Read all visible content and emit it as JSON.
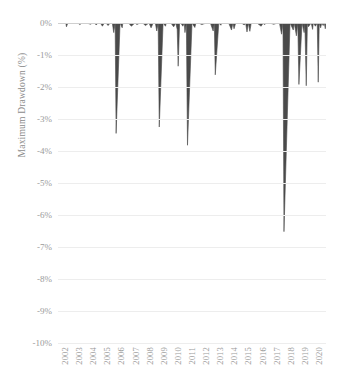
{
  "chart_data": {
    "type": "area",
    "title": "",
    "subtitle": "",
    "xlabel": "",
    "ylabel": "Maximum Drawdown (%)",
    "ylim": [
      -10,
      0
    ],
    "xlim": [
      2002,
      2021
    ],
    "grid": true,
    "legend": "none",
    "series_color": "#4a4a4a",
    "y_ticks": [
      "0%",
      "-1%",
      "-2%",
      "-3%",
      "-4%",
      "-5%",
      "-6%",
      "-7%",
      "-8%",
      "-9%",
      "-10%"
    ],
    "y_tick_values": [
      0,
      -1,
      -2,
      -3,
      -4,
      -5,
      -6,
      -7,
      -8,
      -9,
      -10
    ],
    "x_ticks": [
      "2002",
      "2003",
      "2004",
      "2005",
      "2006",
      "2007",
      "2008",
      "2009",
      "2010",
      "2011",
      "2012",
      "2013",
      "2014",
      "2015",
      "2016",
      "2017",
      "2018",
      "2019",
      "2020"
    ],
    "x_tick_values": [
      2002,
      2003,
      2004,
      2005,
      2006,
      2007,
      2008,
      2009,
      2010,
      2011,
      2012,
      2013,
      2014,
      2015,
      2016,
      2017,
      2018,
      2019,
      2020
    ],
    "series": [
      {
        "name": "Maximum Drawdown",
        "x": [
          2002.0,
          2002.3,
          2002.55,
          2002.6,
          2002.7,
          2003.1,
          2003.4,
          2003.55,
          2003.7,
          2003.9,
          2004.05,
          2004.3,
          2004.45,
          2004.6,
          2004.7,
          2004.85,
          2005.0,
          2005.15,
          2005.28,
          2005.4,
          2005.55,
          2005.7,
          2005.85,
          2005.95,
          2006.05,
          2006.12,
          2006.4,
          2006.55,
          2006.6,
          2006.8,
          2007.0,
          2007.2,
          2007.45,
          2007.6,
          2007.8,
          2008.0,
          2008.2,
          2008.45,
          2008.6,
          2008.75,
          2008.9,
          2009.0,
          2009.1,
          2009.18,
          2009.45,
          2009.62,
          2009.68,
          2009.85,
          2010.0,
          2010.2,
          2010.35,
          2010.45,
          2010.52,
          2010.62,
          2010.7,
          2010.85,
          2010.95,
          2011.0,
          2011.1,
          2011.18,
          2011.5,
          2011.7,
          2011.78,
          2011.95,
          2012.2,
          2012.5,
          2012.8,
          2013.0,
          2013.08,
          2013.15,
          2013.4,
          2013.55,
          2013.6,
          2013.8,
          2014.1,
          2014.3,
          2014.4,
          2014.48,
          2014.6,
          2014.8,
          2015.0,
          2015.2,
          2015.3,
          2015.4,
          2015.5,
          2015.6,
          2015.7,
          2015.85,
          2016.1,
          2016.4,
          2016.55,
          2016.62,
          2016.8,
          2017.0,
          2017.3,
          2017.55,
          2017.7,
          2017.85,
          2017.95,
          2018.02,
          2018.45,
          2018.68,
          2018.75,
          2018.9,
          2019.0,
          2019.08,
          2019.3,
          2019.45,
          2019.5,
          2019.6,
          2019.68,
          2019.75,
          2019.95,
          2020.05,
          2020.1,
          2020.25,
          2020.38,
          2020.45,
          2020.52,
          2020.62,
          2020.7,
          2020.8,
          2020.88,
          2020.95,
          2021.0
        ],
        "values": [
          0.0,
          0.0,
          0.0,
          -0.12,
          0.0,
          0.0,
          0.0,
          -0.05,
          0.0,
          0.0,
          0.0,
          -0.04,
          0.0,
          0.0,
          -0.06,
          0.0,
          0.0,
          -0.1,
          0.0,
          0.0,
          -0.08,
          0.0,
          0.0,
          -0.3,
          0.0,
          -3.45,
          0.0,
          -0.15,
          0.0,
          0.0,
          0.0,
          -0.1,
          0.0,
          -0.05,
          0.0,
          0.0,
          -0.08,
          0.0,
          -0.15,
          0.0,
          0.0,
          -0.25,
          0.0,
          -3.25,
          0.0,
          -0.1,
          0.0,
          0.0,
          0.0,
          -0.12,
          0.0,
          -0.2,
          -1.35,
          0.0,
          0.0,
          -0.1,
          0.0,
          -0.3,
          0.0,
          -3.82,
          0.0,
          -0.14,
          0.0,
          0.0,
          -0.05,
          0.0,
          0.0,
          -0.25,
          0.0,
          -1.62,
          0.0,
          -0.07,
          0.0,
          0.0,
          0.0,
          -0.22,
          0.0,
          -0.18,
          0.0,
          0.0,
          0.0,
          -0.06,
          0.0,
          -0.28,
          0.0,
          -0.26,
          0.0,
          0.0,
          0.0,
          -0.1,
          0.0,
          -0.05,
          0.0,
          0.0,
          -0.04,
          0.0,
          0.0,
          -0.35,
          0.0,
          -6.52,
          0.0,
          -0.22,
          0.0,
          -0.4,
          0.0,
          -1.92,
          0.0,
          -0.3,
          0.0,
          -1.96,
          0.0,
          -0.12,
          0.0,
          -0.2,
          0.0,
          -0.1,
          0.0,
          -1.85,
          0.0,
          -0.15,
          0.0,
          -0.08,
          0.0,
          -0.18,
          0.0
        ]
      }
    ]
  }
}
